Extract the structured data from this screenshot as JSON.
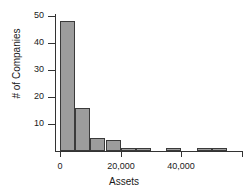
{
  "chart_data": {
    "type": "bar",
    "title": "",
    "subtitle": "",
    "xlabel": "Assets",
    "ylabel": "# of Companies",
    "grid": false,
    "legend": "none",
    "orientation": "vertical",
    "histogram": true,
    "bin_width": 5000,
    "xlim": [
      0,
      60000
    ],
    "ylim": [
      0,
      50
    ],
    "x_ticks": [
      0,
      20000,
      40000,
      60000
    ],
    "x_tick_labels": [
      "0",
      "20,000",
      "40,000",
      ""
    ],
    "y_ticks": [
      10,
      20,
      30,
      40,
      50
    ],
    "y_tick_labels": [
      "10",
      "20",
      "30",
      "40",
      "50"
    ],
    "bin_edges": [
      0,
      5000,
      10000,
      15000,
      20000,
      25000,
      30000,
      35000,
      40000,
      45000,
      50000,
      55000,
      60000
    ],
    "categories": [
      "0-5,000",
      "5,000-10,000",
      "10,000-15,000",
      "15,000-20,000",
      "20,000-25,000",
      "25,000-30,000",
      "30,000-35,000",
      "35,000-40,000",
      "40,000-45,000",
      "45,000-50,000",
      "50,000-55,000",
      "55,000-60,000"
    ],
    "values": [
      48,
      16,
      5,
      4,
      1,
      1,
      0,
      1,
      0,
      1,
      1,
      0
    ],
    "bar_color": "#9c9c9c",
    "bar_edge_color": "#3a3a3a",
    "axis_color": "#333333"
  },
  "axes": {
    "x_title": "Assets",
    "y_title": "# of Companies"
  }
}
